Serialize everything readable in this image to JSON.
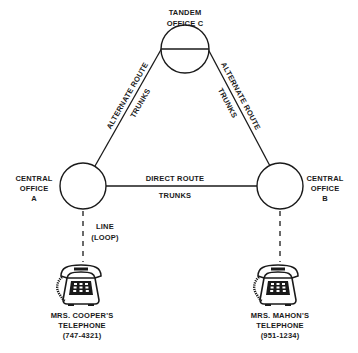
{
  "diagram": {
    "nodes": {
      "tandem": {
        "line1": "TANDEM",
        "line2": "OFFICE C"
      },
      "office_a": {
        "line1": "CENTRAL",
        "line2": "OFFICE",
        "line3": "A"
      },
      "office_b": {
        "line1": "CENTRAL",
        "line2": "OFFICE",
        "line3": "B"
      }
    },
    "edges": {
      "left_alternate": {
        "line1": "ALTERNATE ROUTE",
        "line2": "TRUNKS"
      },
      "right_alternate": {
        "line1": "ALTERNATE ROUTE",
        "line2": "TRUNKS"
      },
      "direct": {
        "line1": "DIRECT ROUTE",
        "line2": "TRUNKS"
      },
      "line_loop": {
        "line1": "LINE",
        "line2": "(LOOP)"
      }
    },
    "phones": {
      "cooper": {
        "line1": "MRS. COOPER'S",
        "line2": "TELEPHONE",
        "line3": "(747-4321)",
        "icon": "telephone-icon"
      },
      "mahon": {
        "line1": "MRS. MAHON'S",
        "line2": "TELEPHONE",
        "line3": "(951-1234)",
        "icon": "telephone-icon"
      }
    },
    "colors": {
      "ink": "#1a1a1a",
      "background": "#ffffff"
    }
  }
}
